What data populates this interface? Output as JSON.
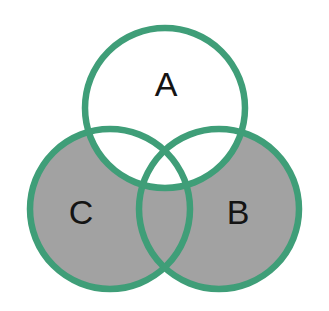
{
  "figure": {
    "type": "venn-diagram",
    "title": "",
    "background_color": "#ffffff",
    "width": 329,
    "height": 311
  },
  "style": {
    "stroke_color": "#3f9e78",
    "stroke_width": 6.5,
    "shaded_fill": "#a2a2a2",
    "unshaded_fill": "#ffffff",
    "label_color": "#141414"
  },
  "sets": [
    {
      "id": "A",
      "label": "A",
      "center_x": 165,
      "center_y": 108,
      "radius": 80,
      "label_x": 166,
      "label_y": 84
    },
    {
      "id": "B",
      "label": "B",
      "center_x": 219,
      "center_y": 209,
      "radius": 80,
      "label_x": 238,
      "label_y": 212
    },
    {
      "id": "C",
      "label": "C",
      "center_x": 110,
      "center_y": 209,
      "radius": 80,
      "label_x": 81,
      "label_y": 212
    }
  ],
  "regions": [
    {
      "id": "A-only",
      "description": "A only",
      "shaded": false
    },
    {
      "id": "B-only",
      "description": "B only",
      "shaded": true
    },
    {
      "id": "C-only",
      "description": "C only",
      "shaded": true
    },
    {
      "id": "A-and-B",
      "description": "A intersect B, not C",
      "shaded": false
    },
    {
      "id": "A-and-C",
      "description": "A intersect C, not B",
      "shaded": false
    },
    {
      "id": "B-and-C",
      "description": "B intersect C, not A",
      "shaded": true
    },
    {
      "id": "A-and-B-and-C",
      "description": "A intersect B intersect C",
      "shaded": false
    },
    {
      "id": "outside",
      "description": "Outside all sets",
      "shaded": false
    }
  ],
  "shaded_expression": "(B union C) minus A"
}
